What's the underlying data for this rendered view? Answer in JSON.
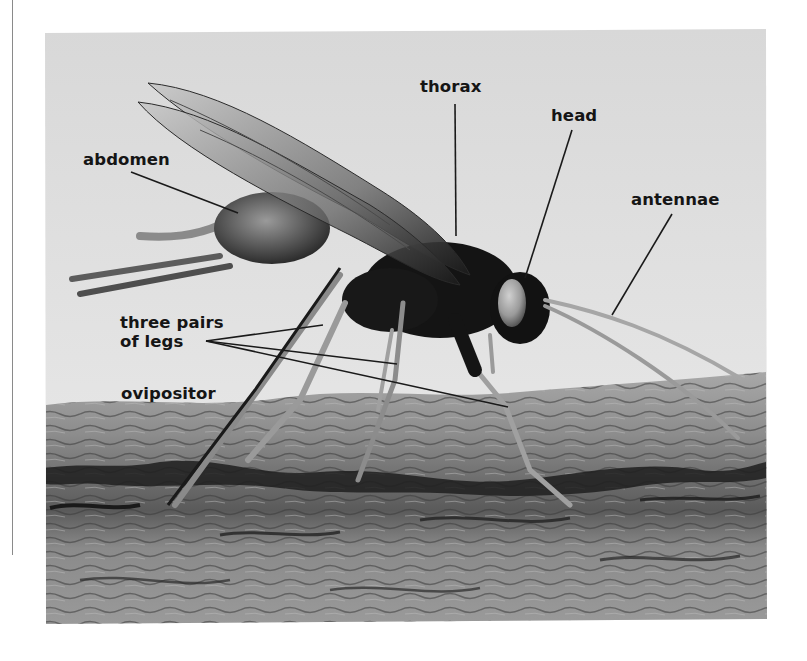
{
  "figure": {
    "labels": {
      "thorax": "thorax",
      "head": "head",
      "abdomen": "abdomen",
      "antennae": "antennae",
      "legs_line1": "three pairs",
      "legs_line2": "of legs",
      "ovipositor": "ovipositor"
    },
    "colors": {
      "sky": "#dcdcdc",
      "bark": "#7a7a7a",
      "insect": "#141414",
      "leader_line": "#1a1a1a",
      "label_text": "#151515"
    }
  }
}
